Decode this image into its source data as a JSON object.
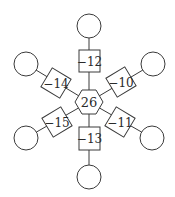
{
  "diagram": {
    "type": "star-graph",
    "center": {
      "shape": "hexagon",
      "label": "26"
    },
    "spokes": [
      {
        "direction": "up",
        "box_label": "−12",
        "end": "circle",
        "end_label": ""
      },
      {
        "direction": "upper-right",
        "box_label": "−10",
        "end": "circle",
        "end_label": ""
      },
      {
        "direction": "lower-right",
        "box_label": "−11",
        "end": "circle",
        "end_label": ""
      },
      {
        "direction": "down",
        "box_label": "−13",
        "end": "circle",
        "end_label": ""
      },
      {
        "direction": "lower-left",
        "box_label": "−15",
        "end": "circle",
        "end_label": ""
      },
      {
        "direction": "upper-left",
        "box_label": "−14",
        "end": "circle",
        "end_label": ""
      }
    ]
  },
  "colors": {
    "stroke": "#3a3a3a",
    "text": "#2a2a2a",
    "background": "#ffffff"
  }
}
